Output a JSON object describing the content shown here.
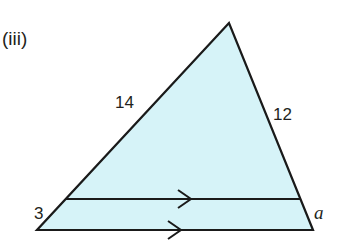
{
  "question_label": "(iii)",
  "colors": {
    "fill": "#d6f3f8",
    "stroke": "#1a1a1a",
    "text": "#231f20"
  },
  "triangle": {
    "apex": [
      229,
      23
    ],
    "base_left": [
      37,
      230
    ],
    "base_right": [
      313,
      230
    ]
  },
  "parallel_line": {
    "left": [
      66,
      199
    ],
    "right": [
      300,
      199
    ]
  },
  "labels": {
    "upper_left_side": "14",
    "upper_right_side": "12",
    "lower_left_segment": "3",
    "lower_right_segment": "a"
  }
}
